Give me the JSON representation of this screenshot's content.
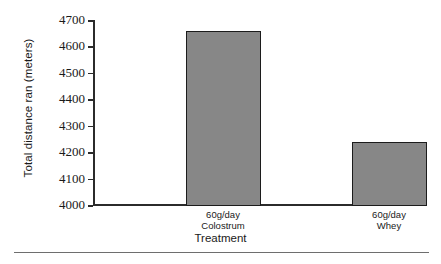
{
  "chart_data": {
    "type": "bar",
    "title": "",
    "xlabel": "Treatment",
    "ylabel": "Total distance ran (meters)",
    "categories": [
      "60g/day Colostrum",
      "60g/day Whey"
    ],
    "category_lines": [
      {
        "line1": "60g/day",
        "line2": "Colostrum"
      },
      {
        "line1": "60g/day",
        "line2": "Whey"
      }
    ],
    "values": [
      4660,
      4240
    ],
    "ylim": [
      4000,
      4700
    ],
    "yticks": [
      4000,
      4100,
      4200,
      4300,
      4400,
      4500,
      4600,
      4700
    ],
    "ytick_labels": [
      "4000",
      "4100",
      "4200",
      "4300",
      "4400",
      "4500",
      "4600",
      "4700"
    ],
    "grid": false,
    "legend": "none",
    "bar_color": "#878787",
    "bar_edge_color": "#1c1c1c",
    "axis_color": "#2b2b2b",
    "background": "#ffffff"
  }
}
